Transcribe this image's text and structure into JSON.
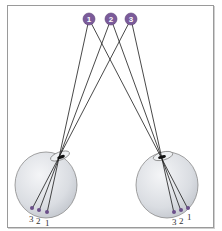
{
  "diagram": {
    "type": "binocular-disparity",
    "points": [
      {
        "id": "1",
        "label": "1",
        "x": 89,
        "y": 19
      },
      {
        "id": "2",
        "label": "2",
        "x": 111,
        "y": 19
      },
      {
        "id": "3",
        "label": "3",
        "x": 131,
        "y": 19
      }
    ],
    "left_eye": {
      "retina_labels": [
        "3",
        "2",
        "1"
      ]
    },
    "right_eye": {
      "retina_labels": [
        "3",
        "2",
        "1"
      ]
    },
    "colors": {
      "point_fill": "#7b5b9a",
      "eyeball_fill": "#d9dde2",
      "eyeball_stroke": "#8a8a8a",
      "ray": "#1a1a1a",
      "frame": "#9a9a9a"
    }
  }
}
